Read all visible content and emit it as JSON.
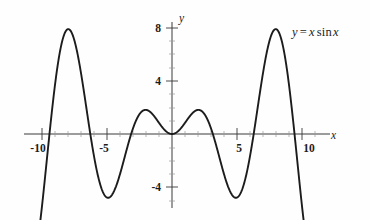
{
  "figure": {
    "background_color": "#fefefe",
    "curve_color": "#1c1c1c",
    "axis_color": "#3a3a3a",
    "annotation": {
      "y_symbol": "y",
      "equals": "=",
      "x_symbol": "x",
      "sin": "sin",
      "x_symbol2": "x",
      "full_text": "y = x sin x"
    },
    "axis_labels": {
      "x": "x",
      "y": "y"
    }
  },
  "chart_data": {
    "type": "line",
    "title": "",
    "subtitle": "",
    "xlabel": "x",
    "ylabel": "y",
    "expression": "y = x sin x",
    "legend": [
      "y = x sin x"
    ],
    "legend_position": "top-right",
    "grid": false,
    "xlim": [
      -10.9,
      10.9
    ],
    "ylim": [
      -5.6,
      8.6
    ],
    "xticks": [
      -10,
      -5,
      5,
      10
    ],
    "xtick_labels": [
      "-10",
      "-5",
      "5",
      "10"
    ],
    "yticks": [
      8,
      4,
      -4
    ],
    "ytick_labels": [
      "8",
      "4",
      "-4"
    ],
    "xtick_minor_step": 1,
    "ytick_minor_step": 1,
    "series": [
      {
        "name": "y = x sin x",
        "x": [
          -10.9,
          -10.6,
          -10.3,
          -10.0,
          -9.7,
          -9.4,
          -9.1,
          -8.8,
          -8.5,
          -8.2,
          -7.9,
          -7.6,
          -7.3,
          -7.0,
          -6.7,
          -6.4,
          -6.1,
          -5.8,
          -5.5,
          -5.2,
          -4.9,
          -4.6,
          -4.3,
          -4.0,
          -3.7,
          -3.4,
          -3.1,
          -2.8,
          -2.5,
          -2.2,
          -1.9,
          -1.6,
          -1.3,
          -1.0,
          -0.7,
          -0.4,
          0.0,
          0.4,
          0.7,
          1.0,
          1.3,
          1.6,
          1.9,
          2.2,
          2.5,
          2.8,
          3.1,
          3.4,
          3.7,
          4.0,
          4.3,
          4.6,
          4.9,
          5.2,
          5.5,
          5.8,
          6.1,
          6.4,
          6.7,
          7.0,
          7.3,
          7.6,
          7.9,
          8.2,
          8.5,
          8.8,
          9.1,
          9.4,
          9.7,
          10.0,
          10.3,
          10.6,
          10.9
        ],
        "y": [
          -5.49,
          -3.1,
          -0.87,
          5.44,
          -2.09,
          0.21,
          2.69,
          5.13,
          7.18,
          8.36,
          8.28,
          7.0,
          4.54,
          -4.6,
          -4.09,
          -1.23,
          1.08,
          2.76,
          3.88,
          4.59,
          4.77,
          4.55,
          3.88,
          3.03,
          1.99,
          0.88,
          -0.13,
          -0.94,
          -1.5,
          -1.77,
          -1.79,
          -1.6,
          -1.25,
          -0.84,
          -0.45,
          -0.16,
          0.0,
          0.16,
          0.45,
          0.84,
          1.25,
          1.6,
          1.79,
          1.77,
          1.5,
          0.94,
          0.13,
          -0.88,
          -1.99,
          -3.03,
          -3.88,
          -4.55,
          -4.77,
          -4.59,
          -3.88,
          -2.76,
          -1.08,
          1.23,
          4.09,
          4.6,
          6.66,
          7.58,
          7.87,
          7.42,
          6.25,
          4.51,
          2.43,
          0.28,
          -1.66,
          -5.44,
          -4.12,
          -2.08,
          5.49
        ],
        "note": "y = x*sin(x) sampled; the drawn curve is the continuous function"
      }
    ],
    "key_points": {
      "local_maxima": [
        {
          "x": -7.98,
          "y": 7.92
        },
        {
          "x": -2.03,
          "y": 1.82
        },
        {
          "x": 2.03,
          "y": 1.82
        },
        {
          "x": 7.98,
          "y": 7.92
        }
      ],
      "local_minima": [
        {
          "x": -4.91,
          "y": -4.81
        },
        {
          "x": 0.0,
          "y": 0.0
        },
        {
          "x": 4.91,
          "y": -4.81
        }
      ],
      "zeros": [
        -9.42,
        -6.28,
        -3.14,
        0.0,
        3.14,
        6.28,
        9.42
      ]
    }
  }
}
